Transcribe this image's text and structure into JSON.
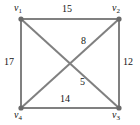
{
  "figure": {
    "type": "weighted-undirected-graph",
    "background_color": "#ffffff",
    "edge_color": "#808080",
    "vertex_color": "#6b6b6b",
    "text_color": "#141414"
  },
  "vertices": [
    {
      "id": "v1",
      "name": "v",
      "subscript": "1",
      "x": 21,
      "y": 19,
      "label_position": "top-left"
    },
    {
      "id": "v2",
      "name": "v",
      "subscript": "2",
      "x": 119,
      "y": 19,
      "label_position": "top-right"
    },
    {
      "id": "v3",
      "name": "v",
      "subscript": "3",
      "x": 119,
      "y": 108,
      "label_position": "bottom-right"
    },
    {
      "id": "v4",
      "name": "v",
      "subscript": "4",
      "x": 21,
      "y": 108,
      "label_position": "bottom-left"
    }
  ],
  "edges": [
    {
      "id": "e-v1-v2",
      "from": "v1",
      "to": "v2",
      "weight": "15",
      "position": "top"
    },
    {
      "id": "e-v1-v4",
      "from": "v1",
      "to": "v4",
      "weight": "17",
      "position": "left"
    },
    {
      "id": "e-v2-v3",
      "from": "v2",
      "to": "v3",
      "weight": "12",
      "position": "right"
    },
    {
      "id": "e-v4-v3",
      "from": "v4",
      "to": "v3",
      "weight": "14",
      "position": "bottom"
    },
    {
      "id": "e-v2-v4",
      "from": "v2",
      "to": "v4",
      "weight": "8",
      "position": "diagonal-upper"
    },
    {
      "id": "e-v1-v3",
      "from": "v1",
      "to": "v3",
      "weight": "5",
      "position": "diagonal-lower"
    }
  ]
}
